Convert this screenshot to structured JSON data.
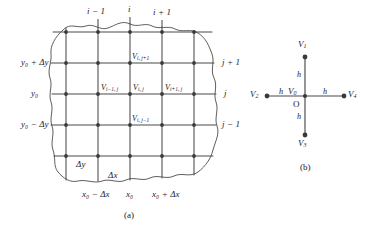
{
  "figure": {
    "panels": [
      {
        "caption": "(a)",
        "name": "finite-difference-grid",
        "top_index_labels": [
          "i − 1",
          "i",
          "i + 1"
        ],
        "right_index_labels": [
          "j + 1",
          "j",
          "j − 1"
        ],
        "y_axis_labels": [
          "y₀ + Δy",
          "y₀",
          "y₀ − Δy"
        ],
        "x_axis_labels": [
          "x₀ − Δx",
          "x₀",
          "x₀ + Δx"
        ],
        "spacing_labels": {
          "dy": "Δy",
          "dx": "Δx"
        },
        "node_labels": {
          "north": "V",
          "north_sub": "i, j+1",
          "west": "V",
          "west_sub": "i−1, j",
          "center": "V",
          "center_sub": "i, j",
          "east": "V",
          "east_sub": "i+1, j",
          "south": "V",
          "south_sub": "i, j−1"
        }
      },
      {
        "caption": "(b)",
        "name": "five-point-star",
        "node_labels": {
          "top": "V",
          "top_sub": "1",
          "left": "V",
          "left_sub": "2",
          "bottom": "V",
          "bottom_sub": "3",
          "right": "V",
          "right_sub": "4",
          "center": "V",
          "center_sub": "0",
          "origin": "O"
        },
        "arm_labels": [
          "h",
          "h",
          "h",
          "h"
        ]
      }
    ],
    "colors": {
      "line": "#4a4a4a",
      "boundary": "#555555",
      "node": "#3a3a3a",
      "text": "#25211f",
      "background": "#ffffff"
    }
  }
}
